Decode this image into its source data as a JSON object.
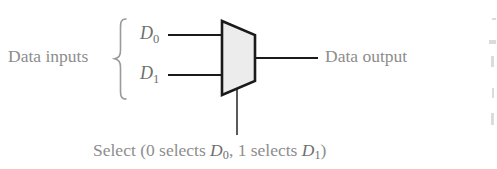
{
  "figure": {
    "background_color": "#ffffff"
  },
  "labels": {
    "data_inputs": "Data inputs",
    "data_output": "Data output",
    "input_0": "D",
    "input_0_sub": "0",
    "input_1": "D",
    "input_1_sub": "1",
    "select_caption_prefix": "Select (0 selects ",
    "select_caption_d0": "D",
    "select_caption_d0_sub": "0",
    "select_caption_middle": ", 1 selects ",
    "select_caption_d1": "D",
    "select_caption_d1_sub": "1",
    "select_caption_suffix": ")"
  },
  "shape": {
    "name": "multiplexer-trapezoid",
    "fill_color": "#ececec",
    "stroke_color": "#1a1a1a",
    "stroke_width": 2.6,
    "points": "222,21 255,35 255,81 222,95"
  },
  "wires": {
    "stroke_color": "#1a1a1a",
    "stroke_width": 2.0,
    "input_0": {
      "x1": 168,
      "y1": 35,
      "x2": 222,
      "y2": 35
    },
    "input_1": {
      "x1": 168,
      "y1": 75,
      "x2": 222,
      "y2": 75
    },
    "output": {
      "x1": 255,
      "y1": 58,
      "x2": 318,
      "y2": 58
    },
    "select": {
      "x1": 237,
      "y1": 90,
      "x2": 237,
      "y2": 135
    }
  },
  "brace": {
    "name": "left-curly-brace",
    "color": "#9a9a9a",
    "top": 18,
    "bottom": 100
  },
  "text_colors": {
    "label_gray": "#8d8d8d",
    "math_gray": "#6f6f6f"
  }
}
